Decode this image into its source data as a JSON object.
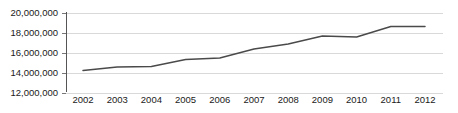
{
  "chart_data": {
    "type": "line",
    "title": "",
    "subtitle": "",
    "xlabel": "",
    "ylabel": "",
    "categories": [
      "2002",
      "2003",
      "2004",
      "2005",
      "2006",
      "2007",
      "2008",
      "2009",
      "2010",
      "2011",
      "2012"
    ],
    "x": [
      2002,
      2003,
      2004,
      2005,
      2006,
      2007,
      2008,
      2009,
      2010,
      2011,
      2012
    ],
    "values": [
      14200000,
      14550000,
      14600000,
      15300000,
      15450000,
      16350000,
      16850000,
      17650000,
      17550000,
      18600000,
      18600000
    ],
    "series": [
      {
        "name": "",
        "values": [
          14200000,
          14550000,
          14600000,
          15300000,
          15450000,
          16350000,
          16850000,
          17650000,
          17550000,
          18600000,
          18600000
        ]
      }
    ],
    "ylim": [
      12000000,
      20000000
    ],
    "ytick_values": [
      12000000,
      14000000,
      16000000,
      18000000,
      20000000
    ],
    "ytick_labels": [
      "12,000,000",
      "14,000,000",
      "16,000,000",
      "18,000,000",
      "20,000,000"
    ],
    "xtick_labels": [
      "2002",
      "2003",
      "2004",
      "2005",
      "2006",
      "2007",
      "2008",
      "2009",
      "2010",
      "2011",
      "2012"
    ],
    "grid": true,
    "grid_axis": "y",
    "legend": false,
    "legend_position": "none",
    "line_color": "#4a4a4a",
    "grid_color": "#d9d9d9",
    "axis_color": "#555555",
    "background_color": "#ffffff",
    "annotations": []
  }
}
